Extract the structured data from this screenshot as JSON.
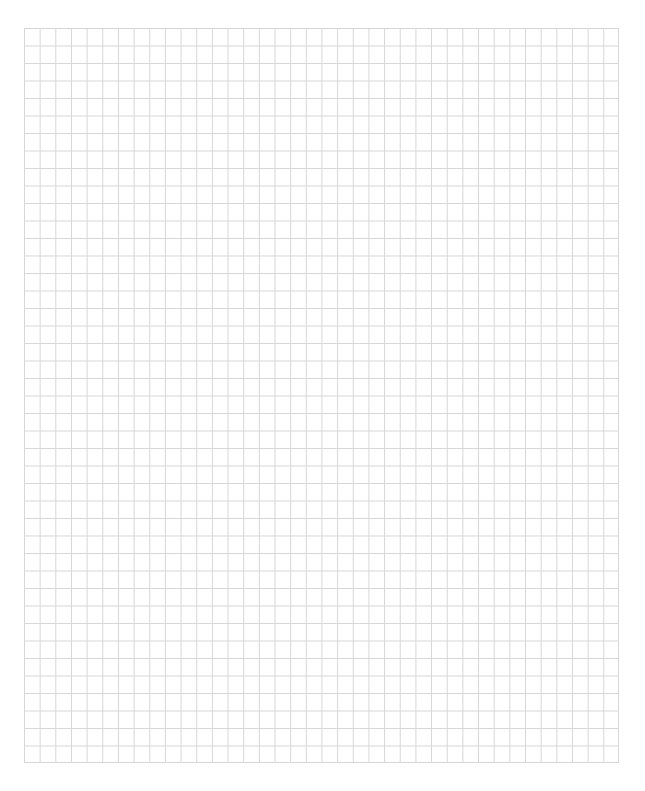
{
  "page": {
    "type": "grid-paper",
    "background_color": "#ffffff"
  },
  "grid": {
    "columns": 38,
    "rows": 42,
    "line_color": "#d6d6d6",
    "left": 24,
    "top": 28,
    "width": 595,
    "height": 735
  }
}
